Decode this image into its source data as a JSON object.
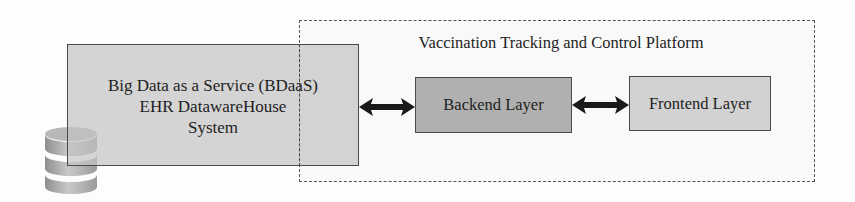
{
  "diagram": {
    "platform": {
      "title": "Vaccination Tracking and Control Platform"
    },
    "bdaas": {
      "line1": "Big Data as a Service (BDaaS)",
      "line2": "EHR DatawareHouse",
      "line3": "System",
      "icon": "database-icon"
    },
    "backend": {
      "label": "Backend Layer"
    },
    "frontend": {
      "label": "Frontend Layer"
    },
    "connections": [
      {
        "from": "Big Data as a Service (BDaaS) EHR DatawareHouse System",
        "to": "Backend Layer",
        "type": "bidirectional"
      },
      {
        "from": "Backend Layer",
        "to": "Frontend Layer",
        "type": "bidirectional"
      }
    ],
    "colors": {
      "bdaas_fill": "#c4c4c4",
      "backend_fill": "#b0b0b0",
      "frontend_fill": "#d2d2d2",
      "border": "#4a4a4a",
      "arrow": "#1a1a1a"
    }
  }
}
